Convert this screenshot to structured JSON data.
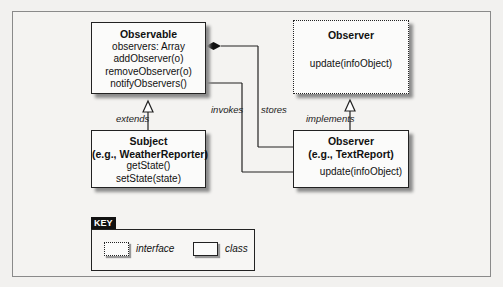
{
  "diagram": {
    "type": "uml-class-diagram",
    "pattern": "Observer"
  },
  "classes": {
    "observable": {
      "title": "Observable",
      "members": [
        "observers: Array",
        "addObserver(o)",
        "removeObserver(o)",
        "notifyObservers()"
      ]
    },
    "subject": {
      "title": "Subject",
      "subtitle": "(e.g., WeatherReporter)",
      "members": [
        "getState()",
        "setState(state)"
      ]
    },
    "observer_interface": {
      "title": "Observer",
      "members": [
        "update(infoObject)"
      ],
      "kind": "interface"
    },
    "observer_concrete": {
      "title": "Observer",
      "subtitle": "(e.g., TextReport)",
      "members": [
        "update(infoObject)"
      ]
    }
  },
  "relationships": [
    {
      "from": "subject",
      "to": "observable",
      "label": "extends",
      "style": "generalization"
    },
    {
      "from": "observer_concrete",
      "to": "observer_interface",
      "label": "implements",
      "style": "realization"
    },
    {
      "from": "observable.observers",
      "to": "observer_concrete",
      "label": "stores",
      "style": "composition"
    },
    {
      "from": "observable.notifyObservers",
      "to": "observer_concrete.update",
      "label": "invokes",
      "style": "call"
    }
  ],
  "labels": {
    "extends": "extends",
    "invokes": "invokes",
    "stores": "stores",
    "implements": "implements"
  },
  "key": {
    "label": "KEY",
    "interface_label": "interface",
    "class_label": "class"
  },
  "colors": {
    "background": "#f2f1ef",
    "box_fill": "#fbfbfa",
    "stroke": "#222222",
    "shadow": "#8c8c8c"
  }
}
